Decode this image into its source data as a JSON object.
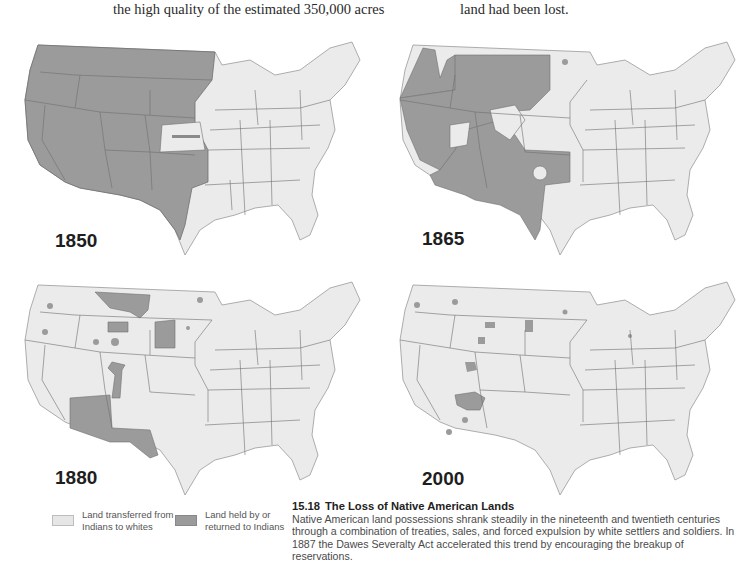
{
  "top_text": {
    "left_column": "the high quality of the estimated 350,000 acres",
    "right_column": "land had been lost."
  },
  "colors": {
    "transferred_land": "#ebebeb",
    "held_land": "#9b9b9b",
    "state_border": "#7a7a7a",
    "background": "#ffffff"
  },
  "maps": [
    {
      "year": "1850",
      "position": "top-left"
    },
    {
      "year": "1865",
      "position": "top-right"
    },
    {
      "year": "1880",
      "position": "bottom-left"
    },
    {
      "year": "2000",
      "position": "bottom-right"
    }
  ],
  "legend": {
    "items": [
      {
        "label_line1": "Land transferred from",
        "label_line2": "Indians to whites",
        "color": "#e6e6e6"
      },
      {
        "label_line1": "Land held by or",
        "label_line2": "returned to Indians",
        "color": "#9b9b9b"
      }
    ]
  },
  "caption": {
    "number": "15.18",
    "title": "The Loss of Native American Lands",
    "body": "Native American land possessions shrank steadily in the nineteenth and twentieth centuries through a combination of treaties, sales, and forced expulsion by white settlers and soldiers. In 1887 the Dawes Severalty Act accelerated this trend by encouraging the breakup of reservations."
  }
}
